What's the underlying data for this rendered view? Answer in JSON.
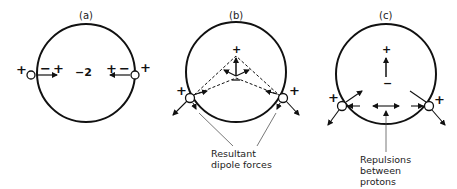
{
  "panels": [
    {
      "label": "(a)",
      "center_charge": "−2",
      "left_dipole": "−+",
      "right_dipole": "+−",
      "proton_charge": "+"
    },
    {
      "label": "(b)",
      "dipole_top": "+",
      "proton_charge": "+",
      "caption": [
        "Resultant",
        "dipole forces"
      ]
    },
    {
      "label": "(c)",
      "dipole_top": "+",
      "dipole_bottom": "−",
      "proton_charge": "+",
      "caption": [
        "Repulsions",
        "between",
        "protons"
      ]
    }
  ],
  "colors": {
    "line": "#111111",
    "background": "#ffffff"
  }
}
